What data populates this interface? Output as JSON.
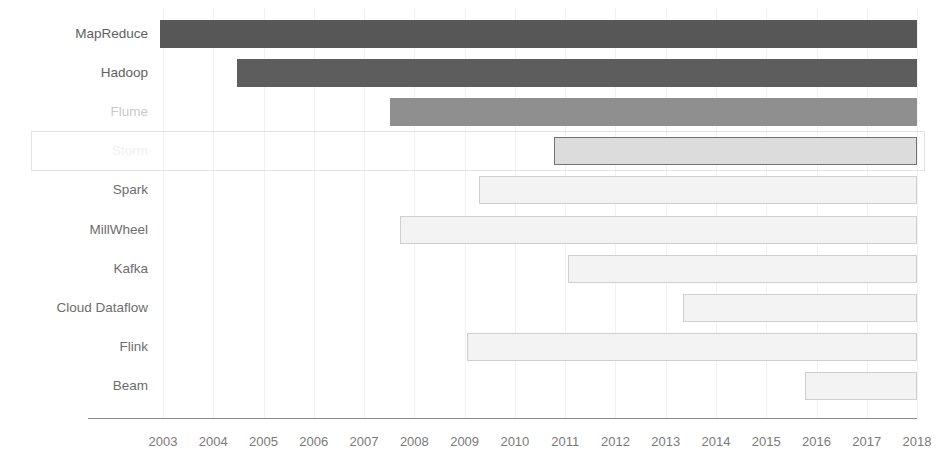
{
  "chart_data": {
    "type": "bar",
    "orientation": "horizontal",
    "subtype": "gantt-timeline",
    "title": "",
    "subtitle": "",
    "xlabel": "",
    "ylabel": "",
    "xlim": [
      2002.5,
      2018.5
    ],
    "grid": true,
    "legend_position": "none",
    "x_tick_labels": [
      "2003",
      "2004",
      "2005",
      "2006",
      "2007",
      "2008",
      "2009",
      "2010",
      "2011",
      "2012",
      "2013",
      "2014",
      "2015",
      "2016",
      "2017",
      "2018"
    ],
    "x_ticks": [
      2003,
      2004,
      2005,
      2006,
      2007,
      2008,
      2009,
      2010,
      2011,
      2012,
      2013,
      2014,
      2015,
      2016,
      2017,
      2018
    ],
    "categories": [
      "MapReduce",
      "Hadoop",
      "Flume",
      "Storm",
      "Spark",
      "MillWheel",
      "Kafka",
      "Cloud Dataflow",
      "Flink",
      "Beam"
    ],
    "bars": [
      {
        "label": "MapReduce",
        "start": 2002.95,
        "end": 2018.0,
        "fill": "#575757",
        "stroke": "#575757",
        "label_color": "#5f5f5f",
        "highlighted": false
      },
      {
        "label": "Hadoop",
        "start": 2004.48,
        "end": 2018.0,
        "fill": "#5d5d5d",
        "stroke": "#5d5d5d",
        "label_color": "#5f5f5f",
        "highlighted": false
      },
      {
        "label": "Flume",
        "start": 2007.52,
        "end": 2018.0,
        "fill": "#8f8f8f",
        "stroke": "#8f8f8f",
        "label_color": "#c9c9c9",
        "highlighted": false
      },
      {
        "label": "Storm",
        "start": 2010.78,
        "end": 2018.0,
        "fill": "#dcdcdc",
        "stroke": "#737373",
        "label_color": "#f1f1f1",
        "highlighted": true
      },
      {
        "label": "Spark",
        "start": 2009.28,
        "end": 2018.0,
        "fill": "#f3f3f3",
        "stroke": "#cfcfcf",
        "label_color": "#6d6d6d",
        "highlighted": false
      },
      {
        "label": "MillWheel",
        "start": 2007.72,
        "end": 2018.0,
        "fill": "#f3f3f3",
        "stroke": "#cfcfcf",
        "label_color": "#6d6d6d",
        "highlighted": false
      },
      {
        "label": "Kafka",
        "start": 2011.06,
        "end": 2018.0,
        "fill": "#f3f3f3",
        "stroke": "#cfcfcf",
        "label_color": "#6d6d6d",
        "highlighted": false
      },
      {
        "label": "Cloud Dataflow",
        "start": 2013.34,
        "end": 2018.0,
        "fill": "#f3f3f3",
        "stroke": "#cfcfcf",
        "label_color": "#6d6d6d",
        "highlighted": false
      },
      {
        "label": "Flink",
        "start": 2009.05,
        "end": 2018.0,
        "fill": "#f3f3f3",
        "stroke": "#cfcfcf",
        "label_color": "#6d6d6d",
        "highlighted": false
      },
      {
        "label": "Beam",
        "start": 2015.78,
        "end": 2018.0,
        "fill": "#f3f3f3",
        "stroke": "#cfcfcf",
        "label_color": "#6d6d6d",
        "highlighted": false
      }
    ]
  },
  "colors": {
    "background": "#ffffff",
    "gridline": "#f2f2f2",
    "axis_line": "#8c8c8c",
    "tick_label": "#7a7a7a",
    "highlight_border": "#e2e2e2"
  }
}
